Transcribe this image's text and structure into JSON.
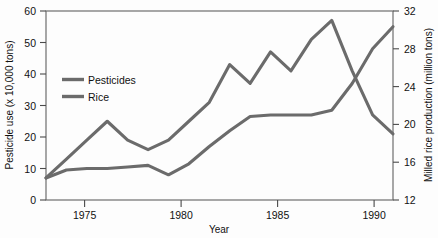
{
  "chart_data": {
    "type": "line",
    "title": "",
    "xlabel": "Year",
    "ylabel": "Pesticide use (x 10,000 tons)",
    "y2label": "Milled rice production (million tons)",
    "xlim": [
      1973,
      1990
    ],
    "ylim": [
      0,
      60
    ],
    "y2lim": [
      12,
      32
    ],
    "xticks": [
      1975,
      1980,
      1985,
      1990
    ],
    "xtick_labels": [
      "1975",
      "1980",
      "1985",
      "1990"
    ],
    "yticks": [
      0,
      10,
      20,
      30,
      40,
      50,
      60
    ],
    "ytick_labels": [
      "0",
      "10",
      "20",
      "30",
      "40",
      "50",
      "60"
    ],
    "y2ticks": [
      12,
      16,
      20,
      24,
      28,
      32
    ],
    "y2tick_labels": [
      "12",
      "16",
      "20",
      "24",
      "28",
      "32"
    ],
    "grid": false,
    "legend_position": "upper-left-inside",
    "line_color": "#6b6b6b",
    "x": [
      1973,
      1974,
      1975,
      1976,
      1977,
      1978,
      1979,
      1980,
      1981,
      1982,
      1983,
      1984,
      1985,
      1986,
      1987,
      1988,
      1989,
      1990
    ],
    "series": [
      {
        "name": "Pesticides",
        "axis": "left",
        "units": "x 10,000 tons",
        "values": [
          7,
          9.5,
          10,
          10,
          10.5,
          11,
          8,
          11.5,
          17,
          22,
          26.5,
          27,
          27,
          27,
          28.5,
          37,
          48,
          55
        ]
      },
      {
        "name": "Rice",
        "axis": "right",
        "units": "million tons",
        "values": [
          15.5,
          17.5,
          19.5,
          21.5,
          19.5,
          18.5,
          19.5,
          21.5,
          23.5,
          27.5,
          25.5,
          28.5,
          26.5,
          29.5,
          31.5,
          26.5,
          21.5,
          19.5
        ],
        "left_equivalent": [
          7,
          13,
          19,
          25,
          19,
          16,
          19,
          25,
          31,
          43,
          37,
          47,
          41,
          51,
          57,
          41,
          27,
          21
        ]
      }
    ]
  },
  "legend": {
    "entries": [
      {
        "label": "Pesticides"
      },
      {
        "label": "Rice"
      }
    ]
  }
}
